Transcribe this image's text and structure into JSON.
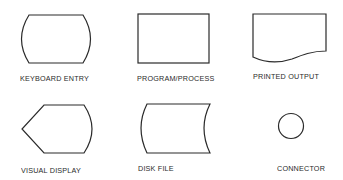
{
  "diagram": {
    "type": "flowchart-symbol-legend",
    "symbols": [
      {
        "id": "keyboard-entry",
        "label": "KEYBOARD ENTRY",
        "shape": "barrel (rectangle with convex curved sides)"
      },
      {
        "id": "program-process",
        "label": "PROGRAM/PROCESS",
        "shape": "rectangle"
      },
      {
        "id": "printed-output",
        "label": "PRINTED OUTPUT",
        "shape": "document (rectangle with wavy bottom)"
      },
      {
        "id": "visual-display",
        "label": "VISUAL DISPLAY",
        "shape": "display (pointed left, curved right)"
      },
      {
        "id": "disk-file",
        "label": "DISK FILE",
        "shape": "stored data (curved left and right sides)"
      },
      {
        "id": "connector",
        "label": "CONNECTOR",
        "shape": "circle"
      }
    ],
    "colors": {
      "stroke": "#2a2a2a",
      "background": "#ffffff"
    }
  }
}
